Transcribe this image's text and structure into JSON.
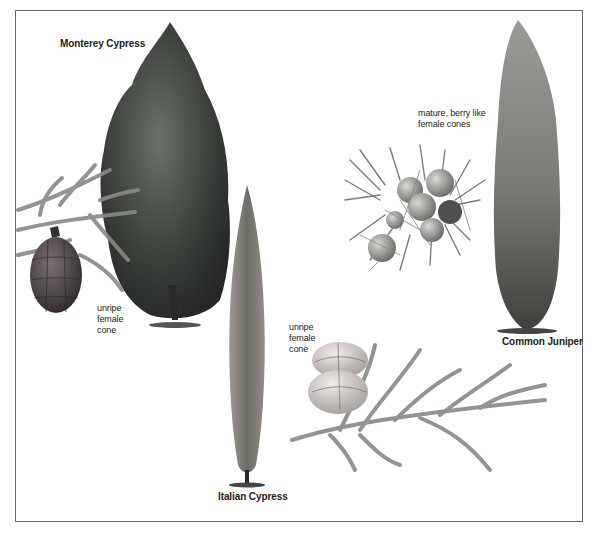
{
  "labels": {
    "monterey_cypress": "Monterey Cypress",
    "monterey_cone_note": "unripe\nfemale\ncone",
    "juniper_berries_note": "mature, berry like\nfemale cones",
    "common_juniper": "Common Juniper",
    "italian_cypress_cone_note": "unripe\nfemale\ncone",
    "italian_cypress": "Italian Cypress"
  },
  "illustrations": [
    {
      "name": "monterey-cypress-tree",
      "subject": "Monterey Cypress tree"
    },
    {
      "name": "monterey-cypress-branch-with-cone",
      "subject": "Monterey Cypress branch with unripe female cone"
    },
    {
      "name": "italian-cypress-tree",
      "subject": "Italian Cypress tree"
    },
    {
      "name": "juniper-berry-cluster",
      "subject": "Common Juniper mature, berry like female cones"
    },
    {
      "name": "common-juniper-tree",
      "subject": "Common Juniper tree"
    },
    {
      "name": "italian-cypress-branch-with-cone",
      "subject": "Italian Cypress branch with unripe female cone"
    }
  ],
  "colors": {
    "frame": "#6a6a6a",
    "dark_foliage": "#3a3f3a",
    "light_foliage": "#8c8c86",
    "cone_dark": "#4a4448",
    "cone_light": "#c9c4c0"
  }
}
